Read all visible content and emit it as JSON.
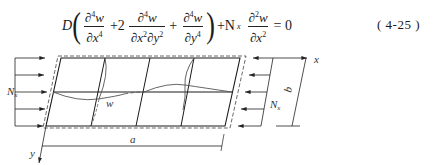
{
  "equation": {
    "coefficient": "D",
    "term1": {
      "num": "∂",
      "num_sup": "4",
      "num_var": "w",
      "den": "∂x",
      "den_sup": "4"
    },
    "plus1": "+2",
    "term2": {
      "num": "∂",
      "num_sup": "4",
      "num_var": "w",
      "den": "∂x",
      "den_sup1": "2",
      "den2": "∂y",
      "den_sup2": "2"
    },
    "plus2": "+",
    "term3": {
      "num": "∂",
      "num_sup": "4",
      "num_var": "w",
      "den": "∂y",
      "den_sup": "4"
    },
    "plus3": "+N",
    "load_sub": "x",
    "term4": {
      "num": "∂",
      "num_sup": "2",
      "num_var": "w",
      "den": "∂x",
      "den_sup": "2"
    },
    "rhs": "= 0",
    "number": "( 4-25 )"
  },
  "figure": {
    "labels": {
      "load_left": "N",
      "load_left_sub": "x",
      "load_right": "N",
      "load_right_sub": "x",
      "deflection": "w",
      "length": "a",
      "width": "b",
      "x_axis": "x",
      "y_axis": "y"
    },
    "colors": {
      "line": "#1a1a1a",
      "curve": "#555555",
      "dashed": "#444444"
    }
  }
}
